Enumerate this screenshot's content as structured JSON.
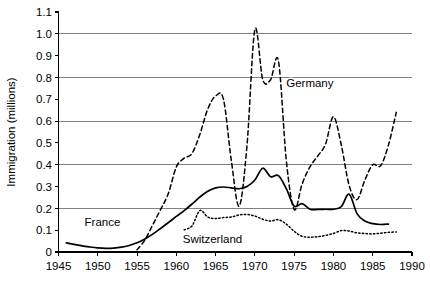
{
  "chart_data": {
    "type": "line",
    "title": "",
    "xlabel": "",
    "ylabel": "Immigration (millions)",
    "xlim": [
      1945,
      1990
    ],
    "ylim": [
      0,
      1.1
    ],
    "grid": true,
    "gridlines_y": [
      0.2,
      0.4,
      0.6,
      0.8,
      1.0
    ],
    "legend_position": "inline-annotations",
    "x_ticks": [
      1945,
      1950,
      1955,
      1960,
      1965,
      1970,
      1975,
      1980,
      1985,
      1990
    ],
    "x_tick_labels": [
      "1945",
      "1950",
      "1955",
      "1960",
      "1965",
      "1970",
      "1975",
      "1980",
      "1985",
      "1990"
    ],
    "y_ticks": [
      0,
      0.1,
      0.2,
      0.3,
      0.4,
      0.5,
      0.6,
      0.7,
      0.8,
      0.9,
      1.0,
      1.1
    ],
    "y_tick_labels": [
      "0",
      "0.1",
      "0.2",
      "0.3",
      "0.4",
      "0.5",
      "0.6",
      "0.7",
      "0.8",
      "0.9",
      "1.0",
      "1.1"
    ],
    "annotations": [
      {
        "text": "France",
        "x": 1950.6,
        "y": 0.118
      },
      {
        "text": "Switzerland",
        "x": 1964.6,
        "y": 0.04
      },
      {
        "text": "Germany",
        "x": 1977.0,
        "y": 0.755
      }
    ],
    "series": [
      {
        "name": "France",
        "style": "solid",
        "x": [
          1946,
          1947,
          1948,
          1949,
          1950,
          1951,
          1952,
          1953,
          1954,
          1955,
          1956,
          1957,
          1958,
          1959,
          1960,
          1961,
          1962,
          1963,
          1964,
          1965,
          1966,
          1967,
          1968,
          1969,
          1970,
          1971,
          1972,
          1973,
          1974,
          1975,
          1976,
          1977,
          1978,
          1979,
          1980,
          1981,
          1982,
          1983,
          1984,
          1985,
          1986,
          1987
        ],
        "y": [
          0.042,
          0.035,
          0.028,
          0.023,
          0.019,
          0.017,
          0.018,
          0.022,
          0.03,
          0.042,
          0.06,
          0.082,
          0.108,
          0.135,
          0.163,
          0.19,
          0.22,
          0.252,
          0.278,
          0.294,
          0.298,
          0.294,
          0.29,
          0.3,
          0.33,
          0.384,
          0.345,
          0.35,
          0.29,
          0.21,
          0.222,
          0.196,
          0.195,
          0.196,
          0.196,
          0.208,
          0.265,
          0.176,
          0.142,
          0.13,
          0.126,
          0.128
        ]
      },
      {
        "name": "Germany",
        "style": "dashed",
        "x": [
          1955,
          1956,
          1957,
          1958,
          1959,
          1960,
          1961,
          1962,
          1963,
          1964,
          1965,
          1966,
          1967,
          1968,
          1969,
          1970,
          1971,
          1972,
          1973,
          1974,
          1975,
          1976,
          1977,
          1978,
          1979,
          1980,
          1981,
          1982,
          1983,
          1984,
          1985,
          1986,
          1987,
          1988
        ],
        "y": [
          0.01,
          0.055,
          0.125,
          0.195,
          0.27,
          0.39,
          0.43,
          0.452,
          0.54,
          0.655,
          0.715,
          0.7,
          0.42,
          0.21,
          0.49,
          1.02,
          0.79,
          0.79,
          0.875,
          0.42,
          0.195,
          0.31,
          0.39,
          0.44,
          0.495,
          0.62,
          0.49,
          0.305,
          0.24,
          0.33,
          0.4,
          0.395,
          0.49,
          0.64
        ]
      },
      {
        "name": "Switzerland",
        "style": "dotted",
        "x": [
          1961,
          1962,
          1963,
          1964,
          1965,
          1966,
          1967,
          1968,
          1969,
          1970,
          1971,
          1972,
          1973,
          1974,
          1975,
          1976,
          1977,
          1978,
          1979,
          1980,
          1981,
          1982,
          1983,
          1984,
          1985,
          1986,
          1987,
          1988
        ],
        "y": [
          0.102,
          0.12,
          0.19,
          0.16,
          0.153,
          0.158,
          0.16,
          0.17,
          0.172,
          0.165,
          0.15,
          0.142,
          0.148,
          0.128,
          0.095,
          0.072,
          0.068,
          0.07,
          0.076,
          0.085,
          0.098,
          0.096,
          0.088,
          0.085,
          0.083,
          0.086,
          0.09,
          0.092
        ]
      }
    ]
  }
}
